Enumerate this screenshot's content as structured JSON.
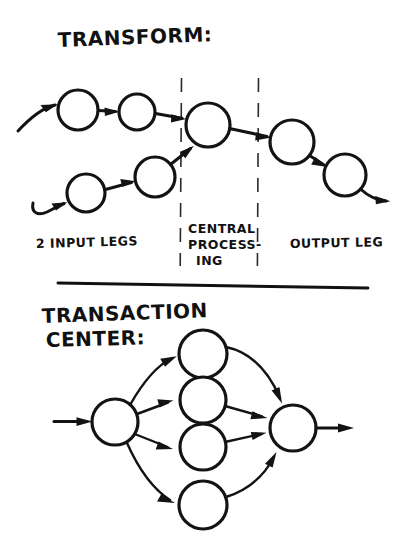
{
  "page": {
    "background_color": "#ffffff",
    "ink_color": "#131313",
    "width": 415,
    "height": 556
  },
  "sections": [
    {
      "id": "transform",
      "title": "TRANSFORM:",
      "captions": [
        {
          "id": "input-legs",
          "lines": [
            "2 INPUT LEGS"
          ]
        },
        {
          "id": "central-processing",
          "lines": [
            "CENTRAL",
            "PROCESS-",
            "ING"
          ]
        },
        {
          "id": "output-leg",
          "lines": [
            "OUTPUT LEG"
          ]
        }
      ],
      "nodes": [
        {
          "id": "in-a1",
          "cx": 78,
          "cy": 110,
          "r": 20
        },
        {
          "id": "in-a2",
          "cx": 137,
          "cy": 112,
          "r": 18
        },
        {
          "id": "central",
          "cx": 208,
          "cy": 125,
          "r": 22
        },
        {
          "id": "in-b1",
          "cx": 86,
          "cy": 193,
          "r": 19
        },
        {
          "id": "in-b2",
          "cx": 155,
          "cy": 177,
          "r": 20
        },
        {
          "id": "out-1",
          "cx": 292,
          "cy": 142,
          "r": 22
        },
        {
          "id": "out-2",
          "cx": 345,
          "cy": 175,
          "r": 21
        }
      ],
      "dividers": [
        {
          "id": "divider-left",
          "x": 181,
          "y1": 78,
          "y2": 266
        },
        {
          "id": "divider-right",
          "x": 258,
          "y1": 78,
          "y2": 266
        }
      ]
    },
    {
      "id": "transaction-center",
      "title_lines": [
        "TRANSACTION",
        "CENTER:"
      ],
      "nodes": [
        {
          "id": "tc-source",
          "cx": 115,
          "cy": 422,
          "r": 23
        },
        {
          "id": "tc-branch-1",
          "cx": 203,
          "cy": 354,
          "r": 24
        },
        {
          "id": "tc-branch-2",
          "cx": 203,
          "cy": 400,
          "r": 23
        },
        {
          "id": "tc-branch-3",
          "cx": 203,
          "cy": 447,
          "r": 23
        },
        {
          "id": "tc-branch-4",
          "cx": 203,
          "cy": 505,
          "r": 24
        },
        {
          "id": "tc-sink",
          "cx": 293,
          "cy": 428,
          "r": 23
        }
      ]
    }
  ],
  "separator": {
    "id": "section-separator",
    "x1": 58,
    "y1": 283,
    "x2": 368,
    "y2": 288
  }
}
